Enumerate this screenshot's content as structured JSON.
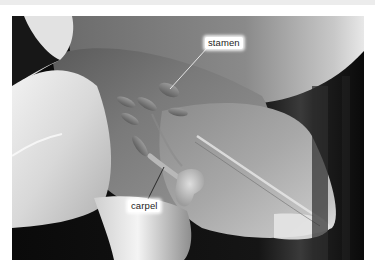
{
  "figure": {
    "background_color": "#ffffff",
    "top_band_color": "#ececec",
    "photo_bounds": {
      "left": 12,
      "top": 16,
      "width": 352,
      "height": 244
    }
  },
  "labels": [
    {
      "id": "stamen",
      "text": "stamen",
      "line_from": [
        208,
        47
      ],
      "line_to": [
        170,
        89
      ]
    },
    {
      "id": "carpel",
      "text": "carpel",
      "line_from": [
        164,
        167
      ],
      "line_to": [
        148,
        198
      ]
    }
  ],
  "colors": {
    "label_bg": "#ffffff",
    "label_text": "#1d1d1d",
    "leader_line": "#f2f2f2",
    "dark_background": "#0c0c0c"
  }
}
